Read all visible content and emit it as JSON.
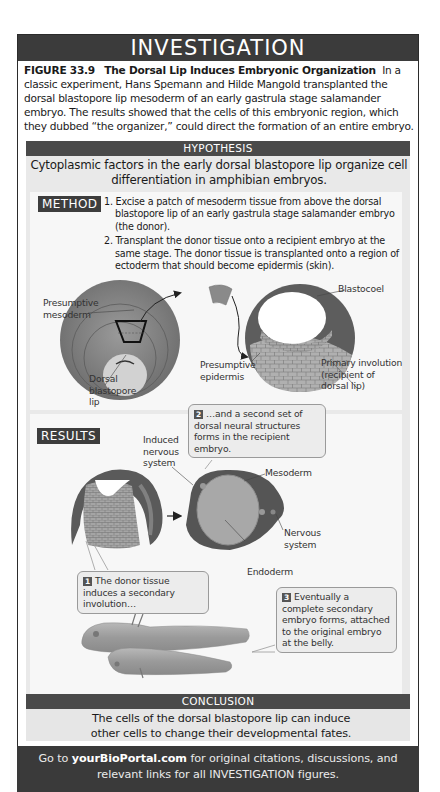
{
  "header": {
    "title": "INVESTIGATION"
  },
  "caption": {
    "figure_label": "FIGURE 33.9",
    "figure_title": "The Dorsal Lip Induces Embryonic Organization",
    "body": "In a classic experiment, Hans Spemann and Hilde Mangold transplanted the dorsal blastopore lip mesoderm of an early gastrula stage salamander embryo. The results showed that the cells of this embryonic region, which they dubbed “the organizer,” could direct the formation of an entire embryo."
  },
  "hypothesis": {
    "label": "HYPOTHESIS",
    "text": "Cytoplasmic factors in the early dorsal blastopore lip organize cell differentiation in amphibian embryos."
  },
  "method": {
    "label": "METHOD",
    "steps": [
      "1. Excise a patch of mesoderm tissue from above the dorsal blastopore lip of an early gastrula stage salamander embryo (the donor).",
      "2. Transplant the donor tissue onto a recipient embryo at the same stage. The donor tissue is transplanted onto a region of ectoderm that should become epidermis (skin)."
    ],
    "labels": {
      "presumptive_mesoderm": "Presumptive\nmesoderm",
      "dorsal_blastopore_lip": "Dorsal\nblastopore\nlip",
      "blastocoel": "Blastocoel",
      "presumptive_epidermis": "Presumptive\nepidermis",
      "primary_involution": "Primary involution\n(recipient of\ndorsal lip)"
    }
  },
  "results": {
    "label": "RESULTS",
    "labels": {
      "induced_nervous_system": "Induced\nnervous\nsystem",
      "mesoderm": "Mesoderm",
      "nervous_system": "Nervous\nsystem",
      "endoderm": "Endoderm"
    },
    "callouts": [
      {
        "num": "1",
        "text": "The donor tissue induces a secondary involution…"
      },
      {
        "num": "2",
        "text": "…and a second set of dorsal neural structures forms in the recipient embryo."
      },
      {
        "num": "3",
        "text": "Eventually a complete secondary embryo forms, attached to the original embryo at the belly."
      }
    ]
  },
  "conclusion": {
    "label": "CONCLUSION",
    "text": "The cells of the dorsal blastopore lip can induce other cells to change their developmental fates."
  },
  "footer": {
    "prefix": "Go to",
    "link": "yourBioPortal.com",
    "suffix": "for original citations, discussions, and relevant links for all INVESTIGATION figures."
  }
}
